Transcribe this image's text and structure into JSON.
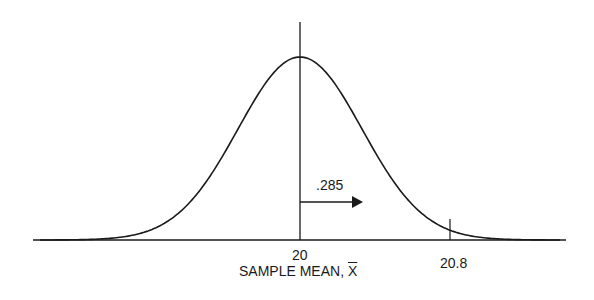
{
  "figure": {
    "type": "normal-distribution-curve",
    "center_label": "20",
    "tick_label": "20.8",
    "area_label": ".285",
    "axis_label_prefix": "SAMPLE MEAN, ",
    "axis_label_symbol": "X",
    "line_color": "#1a1a1a"
  },
  "chart_data": {
    "type": "line",
    "title": "",
    "xlabel": "SAMPLE MEAN, X̄",
    "ylabel": "",
    "distribution": "normal",
    "mean": 20,
    "marked_values": [
      20,
      20.8
    ],
    "annotations": [
      {
        "text": ".285",
        "note": "area between 20 and 20.8, indicated by rightward arrow from mean line"
      }
    ],
    "grid": false
  }
}
